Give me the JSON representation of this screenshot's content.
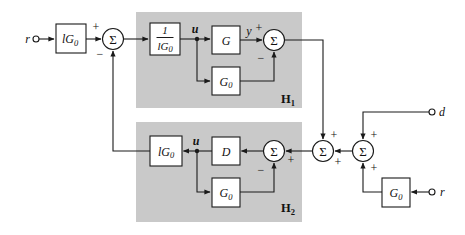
{
  "figure": {
    "type": "control-block-diagram",
    "colors": {
      "panel": "#c9c9c9",
      "line": "#1a1a1a",
      "block_fill": "#ffffff",
      "background": "#ffffff"
    },
    "terminals": {
      "r_in": "r",
      "d_in": "d",
      "r_in2": "r"
    },
    "signals": {
      "u_h1": "u",
      "y_h1": "y",
      "u_h2": "u"
    },
    "sum_symbol": "Σ",
    "signs": {
      "plus": "+",
      "minus": "−"
    },
    "blocks": {
      "lg0_pre": {
        "base": "lG",
        "sub": "0"
      },
      "inv_lg0": {
        "num": "1",
        "den_base": "lG",
        "den_sub": "0"
      },
      "g": {
        "base": "G"
      },
      "g0_h1": {
        "base": "G",
        "sub": "0"
      },
      "lg0_h2": {
        "base": "lG",
        "sub": "0"
      },
      "d_ctrl": {
        "base": "D"
      },
      "g0_h2": {
        "base": "G",
        "sub": "0"
      },
      "g0_right": {
        "base": "G",
        "sub": "0"
      }
    },
    "panels": {
      "h1": {
        "base": "H",
        "sub": "1"
      },
      "h2": {
        "base": "H",
        "sub": "2"
      }
    }
  }
}
